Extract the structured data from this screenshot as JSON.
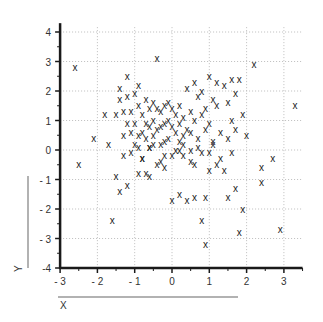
{
  "chart_data": {
    "type": "scatter",
    "title": "",
    "xlabel": "X",
    "ylabel": "Y",
    "xlim": [
      -3,
      3.5
    ],
    "ylim": [
      -4,
      4.3
    ],
    "xticks": [
      -3,
      -2,
      -1,
      0,
      1,
      2,
      3
    ],
    "yticks": [
      -4,
      -3,
      -2,
      -1,
      0,
      1,
      2,
      3,
      4
    ],
    "grid": true,
    "marker": "x",
    "legend": null,
    "x": [
      -2.6,
      -2.1,
      -1.8,
      -1.7,
      -1.5,
      -1.4,
      -1.4,
      -1.3,
      -1.3,
      -1.2,
      -1.2,
      -1.2,
      -1.1,
      -1.1,
      -1.0,
      -1.0,
      -1.0,
      -0.9,
      -0.9,
      -0.9,
      -0.8,
      -0.8,
      -0.8,
      -0.7,
      -0.7,
      -0.7,
      -0.6,
      -0.6,
      -0.6,
      -0.5,
      -0.5,
      -0.5,
      -0.4,
      -0.4,
      -0.4,
      -0.3,
      -0.3,
      -0.3,
      -0.2,
      -0.2,
      -0.2,
      -0.1,
      -0.1,
      -0.1,
      0.0,
      0.0,
      0.0,
      0.1,
      0.1,
      0.2,
      0.2,
      0.2,
      0.3,
      0.3,
      0.4,
      0.4,
      0.5,
      0.5,
      0.5,
      0.6,
      0.6,
      0.7,
      0.7,
      0.8,
      0.8,
      0.9,
      0.9,
      1.0,
      1.0,
      1.1,
      1.1,
      1.2,
      1.2,
      1.3,
      1.4,
      1.5,
      1.5,
      1.6,
      1.6,
      1.7,
      1.7,
      1.8,
      1.9,
      2.0,
      2.2,
      2.4,
      2.7,
      2.9,
      3.3,
      -1.2,
      -0.9,
      -0.6,
      -0.2,
      0.2,
      0.6,
      1.0,
      1.4,
      1.7,
      -1.5,
      -0.8,
      -0.3,
      0.3,
      0.8,
      1.3,
      -2.5,
      -1.6,
      -1.4,
      -0.7,
      0.0,
      0.4,
      0.9,
      1.5,
      1.8,
      2.4,
      0.8,
      1.9,
      0.9,
      -1.3,
      -0.4,
      0.5,
      1.2,
      -0.9,
      0.1,
      0.7,
      1.6,
      -1.1,
      -0.5,
      0.3,
      1.0,
      -0.2,
      0.6,
      1.1,
      -0.6,
      0.2
    ],
    "y": [
      2.8,
      0.4,
      1.2,
      0.2,
      1.2,
      1.7,
      2.1,
      1.3,
      0.5,
      2.5,
      1.8,
      0.9,
      1.3,
      0.6,
      1.9,
      0.9,
      0.2,
      2.2,
      1.5,
      0.5,
      1.2,
      0.6,
      -0.3,
      1.7,
      0.9,
      0.4,
      1.4,
      0.8,
      0.1,
      1.6,
      1.0,
      0.5,
      3.1,
      1.4,
      0.7,
      1.3,
      0.8,
      0.2,
      1.5,
      0.9,
      0.3,
      1.6,
      1.0,
      0.4,
      1.4,
      0.8,
      -0.2,
      1.2,
      0.6,
      1.5,
      0.9,
      0.3,
      1.1,
      0.5,
      2.1,
      0.7,
      1.3,
      0.6,
      0.0,
      2.3,
      1.0,
      1.8,
      0.4,
      2.0,
      1.2,
      1.4,
      0.7,
      2.5,
      0.9,
      1.7,
      0.3,
      2.3,
      1.5,
      0.6,
      2.2,
      1.6,
      0.4,
      2.4,
      1.0,
      1.9,
      0.7,
      2.4,
      1.2,
      0.5,
      2.9,
      -0.6,
      -0.3,
      -2.7,
      1.5,
      -1.2,
      -0.8,
      -0.9,
      -0.6,
      -1.5,
      -1.6,
      -0.7,
      -0.7,
      -1.3,
      -0.9,
      -0.3,
      -0.4,
      -0.2,
      -0.1,
      -0.3,
      -0.5,
      -2.4,
      -1.4,
      -0.8,
      -1.7,
      -1.7,
      -3.2,
      -1.6,
      -2.8,
      -1.1,
      -2.4,
      -2.0,
      -1.6,
      -0.2,
      -0.5,
      -0.4,
      -0.5,
      0.1,
      0.0,
      0.1,
      -0.1,
      -0.1,
      0.2,
      0.2,
      -0.1,
      -0.2,
      -0.5,
      0.2,
      0.1,
      0.0,
      0.2
    ]
  },
  "axes": {
    "x_title": "X",
    "y_title": "Y",
    "x_tick_labels": [
      "- 3",
      "- 2",
      "- 1",
      "0",
      "1",
      "2",
      "3"
    ],
    "y_tick_labels": [
      "-4",
      "- 3",
      "- 2",
      "- 1",
      "0",
      "1",
      "2",
      "3",
      "4"
    ]
  },
  "colors": {
    "axis": "#1a1a1a",
    "grid": "#bdbdbd",
    "marker": "#222222",
    "title_line": "#999999"
  }
}
